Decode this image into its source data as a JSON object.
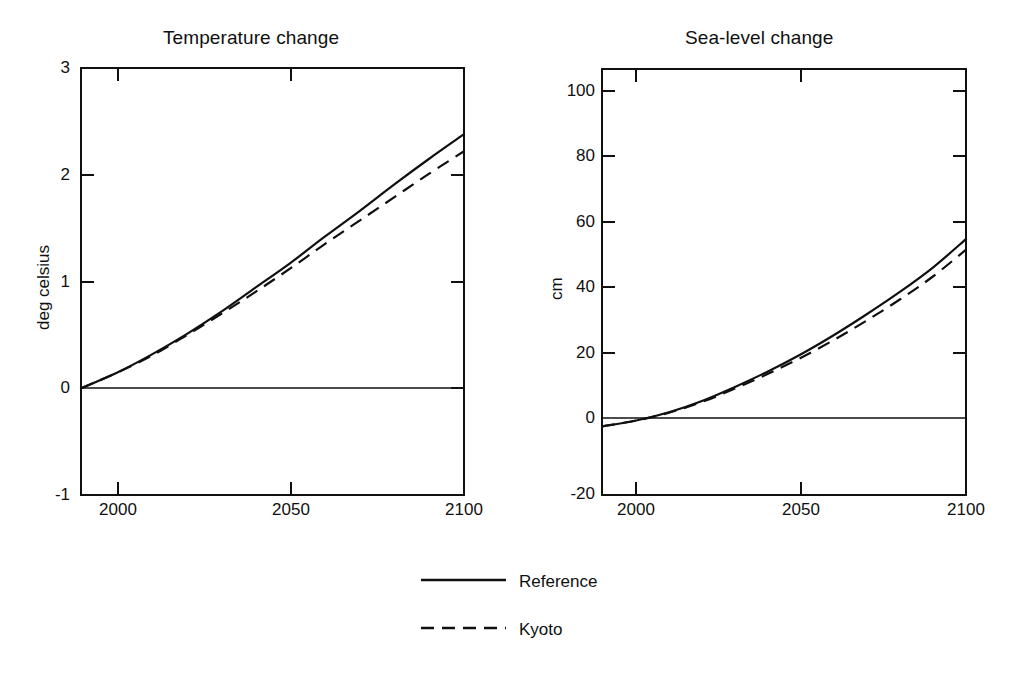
{
  "figure": {
    "background": "#ffffff",
    "ink": "#101010"
  },
  "panels": [
    {
      "id": "temperature",
      "title": "Temperature change",
      "ylabel": "deg celsius",
      "xlabel": "",
      "y_ticks": [
        "3",
        "2",
        "1",
        "0",
        "-1"
      ],
      "x_ticks": [
        "2000",
        "2050",
        "2100"
      ]
    },
    {
      "id": "sea-level",
      "title": "Sea-level change",
      "ylabel": "cm",
      "xlabel": "",
      "y_ticks": [
        "100",
        "80",
        "60",
        "40",
        "20",
        "0",
        "-20"
      ],
      "x_ticks": [
        "2000",
        "2050",
        "2100"
      ]
    }
  ],
  "legend": {
    "position": "bottom-center",
    "entries": [
      {
        "label": "Reference",
        "style": "solid"
      },
      {
        "label": "Kyoto",
        "style": "dashed"
      }
    ]
  },
  "chart_data": [
    {
      "type": "line",
      "title": "Temperature change",
      "xlabel": "",
      "ylabel": "deg celsius",
      "xlim": [
        1990,
        2100
      ],
      "ylim": [
        -1,
        3
      ],
      "yticks": [
        -1,
        0,
        1,
        2,
        3
      ],
      "xticks": [
        2000,
        2050,
        2100
      ],
      "grid": false,
      "zero_line": true,
      "x": [
        1990,
        2000,
        2010,
        2020,
        2030,
        2040,
        2050,
        2060,
        2070,
        2080,
        2090,
        2100
      ],
      "series": [
        {
          "name": "Reference",
          "style": "solid",
          "values": [
            0.0,
            0.14,
            0.31,
            0.5,
            0.71,
            0.94,
            1.17,
            1.42,
            1.66,
            1.91,
            2.15,
            2.38
          ]
        },
        {
          "name": "Kyoto",
          "style": "dashed",
          "values": [
            0.0,
            0.14,
            0.3,
            0.49,
            0.69,
            0.9,
            1.12,
            1.35,
            1.57,
            1.79,
            2.01,
            2.22
          ]
        }
      ]
    },
    {
      "type": "line",
      "title": "Sea-level change",
      "xlabel": "",
      "ylabel": "cm",
      "xlim": [
        1990,
        2100
      ],
      "ylim": [
        -20,
        104
      ],
      "yticks": [
        -20,
        0,
        20,
        40,
        60,
        80,
        100
      ],
      "xticks": [
        2000,
        2050,
        2100
      ],
      "grid": false,
      "zero_line": true,
      "x": [
        1990,
        2000,
        2010,
        2020,
        2030,
        2040,
        2050,
        2060,
        2070,
        2080,
        2090,
        2100
      ],
      "series": [
        {
          "name": "Reference",
          "style": "solid",
          "values": [
            0.0,
            1.6,
            4.0,
            7.3,
            11.4,
            15.9,
            20.9,
            26.5,
            32.6,
            39.1,
            46.2,
            54.5
          ]
        },
        {
          "name": "Kyoto",
          "style": "dashed",
          "values": [
            0.0,
            1.6,
            3.9,
            7.0,
            10.9,
            15.2,
            19.9,
            25.1,
            30.8,
            36.9,
            43.6,
            51.4
          ]
        }
      ]
    }
  ]
}
